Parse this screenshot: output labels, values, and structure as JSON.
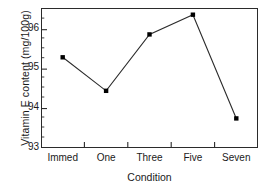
{
  "chart_data": {
    "type": "line",
    "title": "",
    "subtitle": "",
    "xlabel": "Condition",
    "ylabel": "Vitamin E content (mg/100g)",
    "categories": [
      "Immed",
      "One",
      "Three",
      "Five",
      "Seven"
    ],
    "values": [
      95.3,
      94.45,
      95.88,
      96.38,
      93.75
    ],
    "series": [
      {
        "name": "Vitamin E content",
        "values": [
          95.3,
          94.45,
          95.88,
          96.38,
          93.75
        ]
      }
    ],
    "ylim": [
      93.0,
      96.55
    ],
    "xlim": [
      0,
      5
    ],
    "ytick_labels": [
      "93",
      "94",
      "95",
      "96"
    ],
    "ytick_values": [
      93,
      94,
      95,
      96
    ],
    "yminor_step": 0.25,
    "xtick_labels": [
      "Immed",
      "One",
      "Three",
      "Five",
      "Seven"
    ],
    "grid": false,
    "legend": false,
    "legend_position": "none",
    "marker": "square",
    "line_color": "#2b2b2b",
    "marker_color": "#000000",
    "frame": true,
    "annotations": []
  },
  "axes": {
    "y_title": "Vitamin E content (mg/100g)",
    "x_title": "Condition",
    "y_ticks": [
      {
        "label": "96",
        "value": 96
      },
      {
        "label": "95",
        "value": 95
      },
      {
        "label": "94",
        "value": 94
      },
      {
        "label": "93",
        "value": 93
      }
    ],
    "x_ticks": [
      {
        "label": "Immed"
      },
      {
        "label": "One"
      },
      {
        "label": "Three"
      },
      {
        "label": "Five"
      },
      {
        "label": "Seven"
      }
    ]
  }
}
